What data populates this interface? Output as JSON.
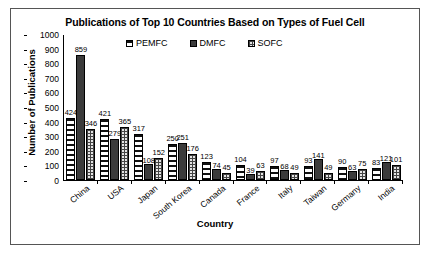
{
  "chart_data": {
    "type": "bar",
    "title": "Publications of Top 10 Countries Based on Types of Fuel Cell",
    "xlabel": "Country",
    "ylabel": "Number of Publications",
    "ylim": [
      0,
      1000
    ],
    "ytick_step": 100,
    "yticks": [
      "1000",
      "900",
      "800",
      "700",
      "600",
      "500",
      "400",
      "300",
      "200",
      "100",
      "0"
    ],
    "grid": false,
    "legend_position": "top-center",
    "categories": [
      "China",
      "USA",
      "Japan",
      "South Korea",
      "Canada",
      "France",
      "Italy",
      "Taiwan",
      "Germany",
      "India"
    ],
    "series": [
      {
        "name": "PEMFC",
        "pattern": "horizontal-stripes",
        "color": "#111111",
        "values": [
          424,
          421,
          317,
          250,
          123,
          104,
          97,
          93,
          90,
          83
        ]
      },
      {
        "name": "DMFC",
        "pattern": "solid-dark",
        "color": "#3b3b3b",
        "values": [
          859,
          279,
          108,
          251,
          74,
          39,
          68,
          141,
          63,
          121
        ]
      },
      {
        "name": "SOFC",
        "pattern": "crosshatch-grid",
        "color": "#e4e4e4",
        "values": [
          346,
          365,
          152,
          176,
          45,
          63,
          49,
          49,
          75,
          101
        ]
      }
    ]
  }
}
